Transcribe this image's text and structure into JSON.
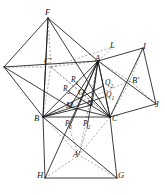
{
  "figure": {
    "background_color": "#ffffff",
    "stroke_color": "#1a1a1a",
    "dashed_color": "#5a5a5a",
    "width": 165,
    "height": 195
  },
  "labels": [
    {
      "id": "F",
      "text": "F",
      "sub": "",
      "prime": false,
      "x": 45,
      "y": 8
    },
    {
      "id": "Cp",
      "text": "C",
      "sub": "",
      "prime": true,
      "x": 44,
      "y": 57
    },
    {
      "id": "L",
      "text": "L",
      "sub": "",
      "prime": false,
      "x": 110,
      "y": 41
    },
    {
      "id": "I",
      "text": "I",
      "sub": "",
      "prime": false,
      "x": 143,
      "y": 42
    },
    {
      "id": "A",
      "text": "A",
      "sub": "",
      "prime": false,
      "x": 95,
      "y": 54
    },
    {
      "id": "Bp",
      "text": "B",
      "sub": "",
      "prime": true,
      "x": 132,
      "y": 76
    },
    {
      "id": "J",
      "text": "J",
      "sub": "",
      "prime": false,
      "x": 155,
      "y": 100
    },
    {
      "id": "R1",
      "text": "R",
      "sub": "1",
      "prime": false,
      "x": 71,
      "y": 76
    },
    {
      "id": "R2",
      "text": "R",
      "sub": "2",
      "prime": false,
      "x": 63,
      "y": 85
    },
    {
      "id": "Q2",
      "text": "Q",
      "sub": "2",
      "prime": false,
      "x": 105,
      "y": 79
    },
    {
      "id": "Q1",
      "text": "Q",
      "sub": "1",
      "prime": false,
      "x": 106,
      "y": 91
    },
    {
      "id": "O",
      "text": "O",
      "sub": "",
      "prime": false,
      "x": 78,
      "y": 88
    },
    {
      "id": "M",
      "text": "M",
      "sub": "",
      "prime": false,
      "x": 66,
      "y": 101
    },
    {
      "id": "N",
      "text": "N",
      "sub": "",
      "prime": false,
      "x": 87,
      "y": 99
    },
    {
      "id": "B",
      "text": "B",
      "sub": "",
      "prime": false,
      "x": 34,
      "y": 114
    },
    {
      "id": "P1",
      "text": "P",
      "sub": "1",
      "prime": false,
      "x": 65,
      "y": 120
    },
    {
      "id": "P2",
      "text": "P",
      "sub": "2",
      "prime": false,
      "x": 83,
      "y": 120
    },
    {
      "id": "C",
      "text": "C",
      "sub": "",
      "prime": false,
      "x": 112,
      "y": 114
    },
    {
      "id": "Ap",
      "text": "A",
      "sub": "",
      "prime": true,
      "x": 73,
      "y": 150
    },
    {
      "id": "H",
      "text": "H",
      "sub": "",
      "prime": false,
      "x": 37,
      "y": 171
    },
    {
      "id": "G",
      "text": "G",
      "sub": "",
      "prime": false,
      "x": 118,
      "y": 171
    }
  ],
  "points": {
    "F": [
      48,
      18
    ],
    "E": [
      4,
      67
    ],
    "Cp": [
      51,
      67
    ],
    "A": [
      98,
      61
    ],
    "L": [
      113,
      47
    ],
    "I": [
      143,
      48
    ],
    "Bp": [
      130,
      81
    ],
    "J": [
      156,
      104
    ],
    "B": [
      43,
      117
    ],
    "C": [
      110,
      117
    ],
    "H": [
      45,
      178
    ],
    "G": [
      117,
      178
    ],
    "Ap": [
      79,
      155
    ],
    "P1": [
      69,
      128
    ],
    "P2": [
      87,
      128
    ],
    "M": [
      70,
      107
    ],
    "N": [
      92,
      105
    ],
    "O": [
      83,
      94
    ],
    "R1": [
      76,
      83
    ],
    "R2": [
      69,
      92
    ],
    "Q1": [
      104,
      97
    ],
    "Q2": [
      103,
      86
    ],
    "K": [
      46,
      108
    ]
  },
  "solid_edges": [
    [
      "F",
      "E"
    ],
    [
      "E",
      "B"
    ],
    [
      "B",
      "F"
    ],
    [
      "F",
      "A"
    ],
    [
      "F",
      "C"
    ],
    [
      "F",
      "B"
    ],
    [
      "E",
      "A"
    ],
    [
      "E",
      "M"
    ],
    [
      "B",
      "C"
    ],
    [
      "B",
      "H"
    ],
    [
      "H",
      "G"
    ],
    [
      "G",
      "C"
    ],
    [
      "B",
      "A"
    ],
    [
      "A",
      "C"
    ],
    [
      "A",
      "I"
    ],
    [
      "I",
      "J"
    ],
    [
      "J",
      "C"
    ],
    [
      "C",
      "A"
    ],
    [
      "A",
      "J"
    ],
    [
      "I",
      "C"
    ],
    [
      "B",
      "G"
    ],
    [
      "H",
      "A"
    ],
    [
      "B",
      "N"
    ],
    [
      "M",
      "C"
    ],
    [
      "A",
      "M"
    ],
    [
      "A",
      "N"
    ],
    [
      "B",
      "Q1"
    ],
    [
      "B",
      "Q2"
    ],
    [
      "R1",
      "C"
    ],
    [
      "R2",
      "C"
    ],
    [
      "A",
      "P1"
    ],
    [
      "A",
      "P2"
    ]
  ],
  "dashed_edges": [
    [
      "F",
      "Cp"
    ],
    [
      "E",
      "Cp"
    ],
    [
      "Cp",
      "A"
    ],
    [
      "Cp",
      "B"
    ],
    [
      "Cp",
      "C"
    ],
    [
      "Cp",
      "L"
    ],
    [
      "A",
      "L"
    ],
    [
      "A",
      "Bp"
    ],
    [
      "I",
      "Bp"
    ],
    [
      "Bp",
      "C"
    ],
    [
      "Bp",
      "J"
    ],
    [
      "A",
      "Ap"
    ],
    [
      "B",
      "Ap"
    ],
    [
      "C",
      "Ap"
    ],
    [
      "H",
      "Ap"
    ],
    [
      "G",
      "Ap"
    ],
    [
      "Ap",
      "P1"
    ],
    [
      "Ap",
      "P2"
    ],
    [
      "B",
      "Bp"
    ],
    [
      "C",
      "Cp"
    ]
  ]
}
